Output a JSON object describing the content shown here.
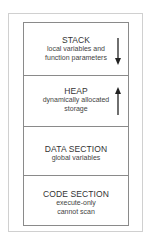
{
  "diagram": {
    "sections": [
      {
        "title": "STACK",
        "lines": [
          "local variables and",
          "function parameters"
        ],
        "arrow": "down"
      },
      {
        "title": "HEAP",
        "lines": [
          "dynamically allocated",
          "storage"
        ],
        "arrow": "up"
      },
      {
        "title": "DATA SECTION",
        "lines": [
          "global variables"
        ]
      },
      {
        "title": "CODE SECTION",
        "lines": [
          "execute-only",
          "cannot scan"
        ]
      }
    ],
    "colors": {
      "frame": "#d0d0d0",
      "box": "#8a8a8a",
      "text": "#333333"
    }
  }
}
